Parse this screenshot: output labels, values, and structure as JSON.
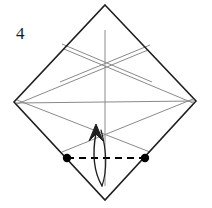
{
  "figure": {
    "type": "origami-fold-diagram",
    "step_label": "4",
    "background_color": "#ffffff",
    "outline_color": "#1f1f1f",
    "crease_color": "#8a8a8a",
    "marker_color": "#000000",
    "dashed_line_color": "#000000",
    "arrow_color": "#1f1f1f"
  },
  "canvas": {
    "width": 212,
    "height": 208
  },
  "outline": {
    "name": "square-rotated-diamond",
    "points": "105,5 196,101 105,200 14,102",
    "vertices": {
      "top": [
        105,
        5
      ],
      "right": [
        196,
        101
      ],
      "bottom": [
        105,
        200
      ],
      "left": [
        14,
        102
      ]
    },
    "stroke_width": 1.6
  },
  "creases": [
    {
      "name": "vertical-center-crease",
      "x1": 105,
      "y1": 30,
      "x2": 105,
      "y2": 186
    },
    {
      "name": "horizontal-center-crease",
      "x1": 16,
      "y1": 103,
      "x2": 194,
      "y2": 101
    },
    {
      "name": "upper-left-diagonal-crease",
      "x1": 62,
      "y1": 44,
      "x2": 152,
      "y2": 82
    },
    {
      "name": "upper-right-diagonal-crease",
      "x1": 150,
      "y1": 45,
      "x2": 60,
      "y2": 82
    },
    {
      "name": "left-vertex-to-lower-right-crease",
      "x1": 17,
      "y1": 100,
      "x2": 150,
      "y2": 152
    },
    {
      "name": "right-vertex-to-lower-left-crease",
      "x1": 193,
      "y1": 99,
      "x2": 62,
      "y2": 152
    },
    {
      "name": "left-vertex-to-upper-right-crease",
      "x1": 17,
      "y1": 104,
      "x2": 148,
      "y2": 50
    },
    {
      "name": "right-vertex-to-upper-left-crease",
      "x1": 193,
      "y1": 103,
      "x2": 64,
      "y2": 49
    }
  ],
  "markers": [
    {
      "name": "left-reference-point",
      "cx": 67,
      "cy": 158,
      "r": 4.2
    },
    {
      "name": "right-reference-point",
      "cx": 145,
      "cy": 158,
      "r": 4.2
    }
  ],
  "dashed_fold_line": {
    "name": "valley-fold-dashed-line",
    "x1": 67,
    "y1": 158,
    "x2": 145,
    "y2": 158,
    "dash_pattern": "7 5",
    "stroke_width": 1.8
  },
  "fold_arrow": {
    "name": "upward-fold-arrow",
    "shaft_path": "M 102 186 C 94 172 92 154 96 133",
    "return_path": "M 102 186 C 108 168 106 148 101 130",
    "head_path": "M 96 124 L 89 141 L 96 134 L 103 141 Z",
    "stroke_width": 1.5,
    "direction": "up"
  }
}
